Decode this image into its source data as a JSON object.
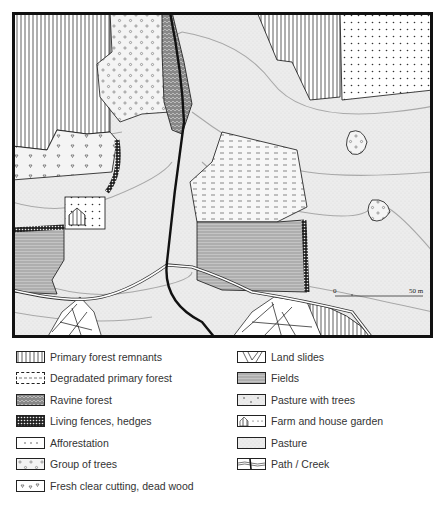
{
  "map": {
    "scale_bar": {
      "start_label": "0",
      "end_label": "50 m"
    },
    "colors": {
      "frame": "#111111",
      "pasture": "#ececec",
      "contour": "#a8a8a8",
      "fields": "#b8b8b8",
      "creek": "#111111"
    }
  },
  "legend": {
    "left": [
      {
        "label": "Primary forest remnants",
        "icon": "vertical-lines-swatch"
      },
      {
        "label": "Degradated primary forest",
        "icon": "dashed-lines-swatch"
      },
      {
        "label": "Ravine forest",
        "icon": "wavy-hatch-swatch"
      },
      {
        "label": "Living fences, hedges",
        "icon": "crosshatch-swatch"
      },
      {
        "label": "Afforestation",
        "icon": "dots-swatch"
      },
      {
        "label": "Group of trees",
        "icon": "circles-on-stipple-swatch"
      },
      {
        "label": "Fresh clear cutting, dead wood",
        "icon": "triangles-swatch"
      }
    ],
    "right": [
      {
        "label": "Land slides",
        "icon": "broken-lines-swatch"
      },
      {
        "label": "Fields",
        "icon": "horizontal-lines-swatch"
      },
      {
        "label": "Pasture with trees",
        "icon": "dots-on-stipple-swatch"
      },
      {
        "label": "Farm and house garden",
        "icon": "house-swatch"
      },
      {
        "label": "Pasture",
        "icon": "stipple-swatch"
      },
      {
        "label": "Path / Creek",
        "icon": "path-creek-swatch"
      }
    ]
  }
}
